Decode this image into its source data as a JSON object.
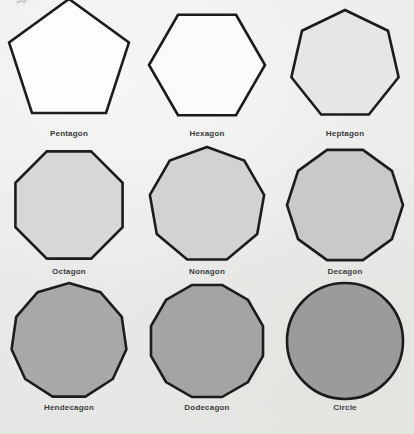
{
  "page": {
    "top_cut_text": "36",
    "background_color": "#ebebea",
    "stroke_color": "#1c1c1c",
    "label_color": "#39393a"
  },
  "figure": {
    "columns": 3,
    "rows": 3
  },
  "shapes": [
    {
      "label": "Pentagon",
      "sides": 5,
      "orientation": "point-up",
      "fill": "#fdfdfc",
      "radius": 63,
      "rotation_deg": -90
    },
    {
      "label": "Hexagon",
      "sides": 6,
      "orientation": "flat-top",
      "fill": "#fbfbfa",
      "radius": 58,
      "rotation_deg": -60
    },
    {
      "label": "Heptagon",
      "sides": 7,
      "orientation": "point-up",
      "fill": "#e6e6e5",
      "radius": 55,
      "rotation_deg": -90
    },
    {
      "label": "Octagon",
      "sides": 8,
      "orientation": "flat-top",
      "fill": "#d7d7d6",
      "radius": 58,
      "rotation_deg": -67.5
    },
    {
      "label": "Nonagon",
      "sides": 9,
      "orientation": "point-up",
      "fill": "#d2d2d1",
      "radius": 58,
      "rotation_deg": -90
    },
    {
      "label": "Decagon",
      "sides": 10,
      "orientation": "flat-top",
      "fill": "#c9c9c8",
      "radius": 58,
      "rotation_deg": -72
    },
    {
      "label": "Hendecagon",
      "sides": 11,
      "orientation": "point-up",
      "fill": "#a8a8a7",
      "radius": 58,
      "rotation_deg": -90
    },
    {
      "label": "Dodecagon",
      "sides": 12,
      "orientation": "flat-top",
      "fill": "#a4a4a3",
      "radius": 58,
      "rotation_deg": -75
    },
    {
      "label": "Circle",
      "sides": 0,
      "orientation": "none",
      "fill": "#9b9b9a",
      "radius": 58,
      "rotation_deg": 0
    }
  ]
}
